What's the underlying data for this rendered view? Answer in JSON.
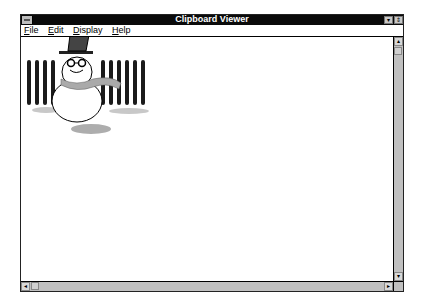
{
  "window": {
    "title": "Clipboard Viewer",
    "system_menu_icon": "system-menu-icon",
    "minimize_icon": "▾",
    "maximize_icon": "⇕"
  },
  "menubar": {
    "items": [
      {
        "accel": "F",
        "rest": "ile"
      },
      {
        "accel": "E",
        "rest": "dit"
      },
      {
        "accel": "D",
        "rest": "isplay"
      },
      {
        "accel": "H",
        "rest": "elp"
      }
    ]
  },
  "content": {
    "image_description": "Clipboard image: snowman with top hat, round glasses and scarf in front of a picket fence"
  },
  "scrollbars": {
    "up_arrow": "▴",
    "down_arrow": "▾",
    "left_arrow": "◂",
    "right_arrow": "▸"
  },
  "colors": {
    "titlebar": "#0a0a0a",
    "scrollbar": "#c0c0c0"
  }
}
